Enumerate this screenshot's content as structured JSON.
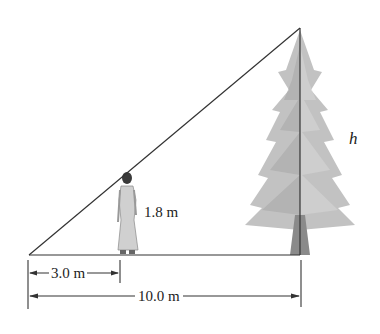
{
  "diagram": {
    "type": "similar-triangles-height",
    "labels": {
      "person_height": "1.8 m",
      "short_distance": "3.0 m",
      "long_distance": "10.0 m",
      "tree_height": "h"
    },
    "colors": {
      "line": "#333333",
      "tree": "#b5b5b5",
      "trunk": "#8a8a8a",
      "person": "#c9c9c9"
    }
  }
}
